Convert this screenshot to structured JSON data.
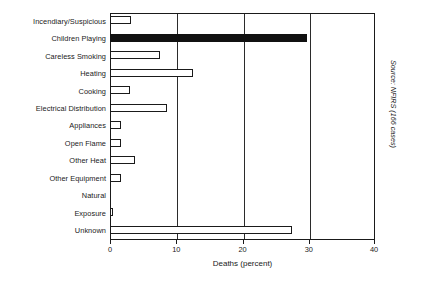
{
  "chart_data": {
    "type": "bar",
    "orientation": "horizontal",
    "title": "",
    "xlabel": "Deaths (percent)",
    "ylabel": "",
    "xlim": [
      0,
      40
    ],
    "xticks": [
      0,
      10,
      20,
      30,
      40
    ],
    "grid": true,
    "grid_axis": "x",
    "legend": false,
    "categories": [
      "Incendiary/Suspicious",
      "Children Playing",
      "Careless Smoking",
      "Heating",
      "Cooking",
      "Electrical Distribution",
      "Appliances",
      "Open Flame",
      "Other Heat",
      "Other Equipment",
      "Natural",
      "Exposure",
      "Unknown"
    ],
    "values": [
      3.2,
      29.8,
      7.6,
      12.5,
      3.0,
      8.6,
      1.7,
      1.7,
      3.7,
      1.7,
      0.0,
      0.5,
      27.4
    ],
    "bar_styles": [
      "open",
      "filled",
      "open",
      "open",
      "open",
      "open",
      "open",
      "open",
      "open",
      "open",
      "open",
      "open",
      "open"
    ],
    "colors": {
      "bar_fill_open": "#ffffff",
      "bar_fill_highlight": "#111111",
      "bar_edge": "#1a1a1a",
      "axis": "#1a1a1a",
      "grid": "#2b2b2b",
      "text": "#1a1a1a",
      "background": "#ffffff"
    },
    "annotations": [
      {
        "name": "source-note",
        "text": "Source: NFIRS (166 cases)",
        "rotation": 90
      }
    ]
  },
  "source_note": "Source: NFIRS (166 cases)"
}
